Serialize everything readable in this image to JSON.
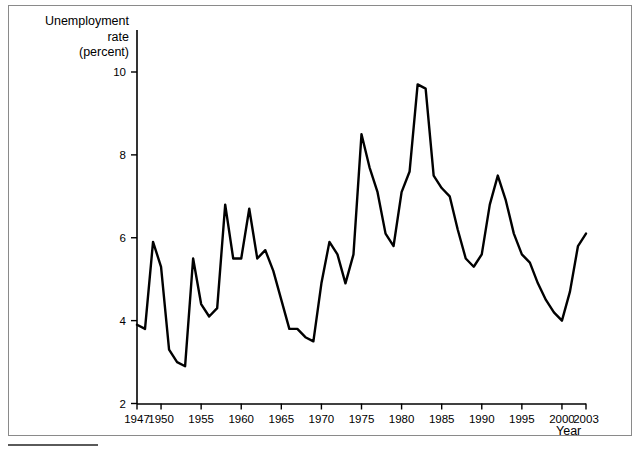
{
  "figure": {
    "y_axis_title_lines": [
      "Unemployment",
      "rate",
      "(percent)"
    ],
    "x_axis_title": "Year"
  },
  "chart_data": {
    "type": "line",
    "title": "",
    "subtitle": "",
    "xlabel": "Year",
    "ylabel": "Unemployment rate (percent)",
    "xlim": [
      1947,
      2003
    ],
    "ylim": [
      2,
      10
    ],
    "grid": false,
    "legend": null,
    "x_ticks": [
      1947,
      1950,
      1955,
      1960,
      1965,
      1970,
      1975,
      1980,
      1985,
      1990,
      1995,
      2000,
      2003
    ],
    "x_tick_labels": [
      "1947",
      "1950",
      "1955",
      "1960",
      "1965",
      "1970",
      "1975",
      "1980",
      "1985",
      "1990",
      "1995",
      "2000",
      "2003"
    ],
    "y_ticks": [
      2,
      4,
      6,
      8,
      10
    ],
    "y_tick_labels": [
      "2",
      "4",
      "6",
      "8",
      "10"
    ],
    "series": [
      {
        "name": "Unemployment rate",
        "color": "#000000",
        "x": [
          1947,
          1948,
          1949,
          1950,
          1951,
          1952,
          1953,
          1954,
          1955,
          1956,
          1957,
          1958,
          1959,
          1960,
          1961,
          1962,
          1963,
          1964,
          1965,
          1966,
          1967,
          1968,
          1969,
          1970,
          1971,
          1972,
          1973,
          1974,
          1975,
          1976,
          1977,
          1978,
          1979,
          1980,
          1981,
          1982,
          1983,
          1984,
          1985,
          1986,
          1987,
          1988,
          1989,
          1990,
          1991,
          1992,
          1993,
          1994,
          1995,
          1996,
          1997,
          1998,
          1999,
          2000,
          2001,
          2002,
          2003
        ],
        "values": [
          3.9,
          3.8,
          5.9,
          5.3,
          3.3,
          3.0,
          2.9,
          5.5,
          4.4,
          4.1,
          4.3,
          6.8,
          5.5,
          5.5,
          6.7,
          5.5,
          5.7,
          5.2,
          4.5,
          3.8,
          3.8,
          3.6,
          3.5,
          4.9,
          5.9,
          5.6,
          4.9,
          5.6,
          8.5,
          7.7,
          7.1,
          6.1,
          5.8,
          7.1,
          7.6,
          9.7,
          9.6,
          7.5,
          7.2,
          7.0,
          6.2,
          5.5,
          5.3,
          5.6,
          6.8,
          7.5,
          6.9,
          6.1,
          5.6,
          5.4,
          4.9,
          4.5,
          4.2,
          4.0,
          4.7,
          5.8,
          6.1
        ]
      }
    ]
  }
}
